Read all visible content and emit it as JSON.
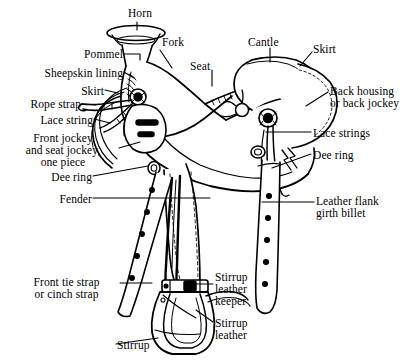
{
  "figure": {
    "style": "black-and-white line engraving",
    "colors": {
      "ink": "#000000",
      "background": "#ffffff"
    }
  },
  "labels": [
    {
      "id": "horn",
      "text": "Horn",
      "align": "center",
      "x": 117,
      "y": 8,
      "w": 46
    },
    {
      "id": "fork",
      "text": "Fork",
      "align": "left",
      "x": 162,
      "y": 37,
      "w": 46
    },
    {
      "id": "cantle",
      "text": "Cantle",
      "align": "left",
      "x": 248,
      "y": 37,
      "w": 54
    },
    {
      "id": "skirt-right",
      "text": "Skirt",
      "align": "left",
      "x": 313,
      "y": 44,
      "w": 42
    },
    {
      "id": "seat",
      "text": "Seat",
      "align": "left",
      "x": 190,
      "y": 61,
      "w": 40
    },
    {
      "id": "pommel",
      "text": "Pommel",
      "align": "right",
      "x": 55,
      "y": 49,
      "w": 68
    },
    {
      "id": "sheepskin-lining",
      "text": "Sheepskin lining",
      "align": "right",
      "x": 18,
      "y": 68,
      "w": 105
    },
    {
      "id": "skirt-left",
      "text": "Skirt",
      "align": "right",
      "x": 58,
      "y": 86,
      "w": 46
    },
    {
      "id": "rope-strap",
      "text": "Rope strap",
      "align": "right",
      "x": 8,
      "y": 99,
      "w": 73
    },
    {
      "id": "lace-string",
      "text": "Lace string",
      "align": "right",
      "x": 20,
      "y": 115,
      "w": 73
    },
    {
      "id": "front-and-seat-jockey",
      "text": "Front jockey\nand seat jockey,\none piece",
      "align": "center",
      "x": 8,
      "y": 133,
      "w": 110
    },
    {
      "id": "dee-ring-left",
      "text": "Dee ring",
      "align": "right",
      "x": 30,
      "y": 172,
      "w": 62
    },
    {
      "id": "fender",
      "text": "Fender",
      "align": "right",
      "x": 37,
      "y": 194,
      "w": 55
    },
    {
      "id": "front-tie-strap",
      "text": "Front tie strap\nor cinch strap",
      "align": "center",
      "x": 14,
      "y": 277,
      "w": 105
    },
    {
      "id": "stirrup",
      "text": "Stirrup",
      "align": "left",
      "x": 117,
      "y": 340,
      "w": 52
    },
    {
      "id": "back-housing",
      "text": "Back housing\nor back jockey",
      "align": "left",
      "x": 330,
      "y": 86,
      "w": 84
    },
    {
      "id": "lace-strings",
      "text": "Lace strings",
      "align": "left",
      "x": 313,
      "y": 128,
      "w": 80
    },
    {
      "id": "dee-ring-right",
      "text": "Dee ring",
      "align": "left",
      "x": 313,
      "y": 150,
      "w": 62
    },
    {
      "id": "leather-flank-billet",
      "text": "Leather flank\ngirth billet",
      "align": "left",
      "x": 316,
      "y": 196,
      "w": 80
    },
    {
      "id": "stirrup-leather-keeper",
      "text": "Stirrup\nleather\nkeeper",
      "align": "left",
      "x": 215,
      "y": 272,
      "w": 60
    },
    {
      "id": "stirrup-leather",
      "text": "Stirrup\nleather",
      "align": "left",
      "x": 215,
      "y": 318,
      "w": 60
    }
  ],
  "parts": [
    "Horn",
    "Fork",
    "Cantle",
    "Skirt",
    "Seat",
    "Pommel",
    "Sheepskin lining",
    "Rope strap",
    "Lace string",
    "Front jockey and seat jockey, one piece",
    "Dee ring",
    "Fender",
    "Front tie strap or cinch strap",
    "Stirrup",
    "Back housing or back jockey",
    "Lace strings",
    "Leather flank girth billet",
    "Stirrup leather keeper",
    "Stirrup leather"
  ]
}
